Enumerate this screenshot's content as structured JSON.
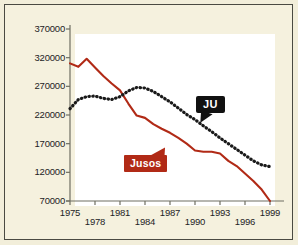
{
  "chart_data": {
    "type": "line",
    "title": "",
    "xlabel": "",
    "ylabel": "",
    "xlim": [
      1975,
      1999
    ],
    "ylim": [
      70000,
      370000
    ],
    "grid": false,
    "legend_position": "inline-callouts",
    "x": [
      1975,
      1976,
      1977,
      1978,
      1979,
      1980,
      1981,
      1982,
      1983,
      1984,
      1985,
      1986,
      1987,
      1988,
      1989,
      1990,
      1991,
      1992,
      1993,
      1994,
      1995,
      1996,
      1997,
      1998,
      1999
    ],
    "series": [
      {
        "name": "Jusos",
        "style": "solid",
        "color": "#b12a16",
        "values": [
          310000,
          304000,
          318000,
          303000,
          288000,
          275000,
          263000,
          240000,
          219000,
          215000,
          204000,
          196000,
          189000,
          180000,
          170000,
          158000,
          156000,
          156000,
          153000,
          140000,
          131000,
          118000,
          105000,
          90000,
          70000
        ]
      },
      {
        "name": "JU",
        "style": "dotted",
        "color": "#1a1a1a",
        "values": [
          231000,
          247000,
          252000,
          253000,
          249000,
          247000,
          252000,
          262000,
          268000,
          267000,
          261000,
          252000,
          243000,
          232000,
          221000,
          212000,
          201000,
          191000,
          180000,
          170000,
          160000,
          150000,
          140000,
          133000,
          130000
        ]
      }
    ],
    "yticks": [
      70000,
      120000,
      170000,
      220000,
      270000,
      320000,
      370000
    ],
    "ytick_labels": [
      "70000",
      "120000",
      "170000",
      "220000",
      "270000",
      "320000",
      "370000"
    ],
    "xticks": [
      1975,
      1978,
      1981,
      1984,
      1987,
      1990,
      1993,
      1996,
      1999
    ],
    "xtick_labels": [
      "1975",
      "1978",
      "1981",
      "1984",
      "1987",
      "1990",
      "1993",
      "1996",
      "1999"
    ],
    "annotations": [
      {
        "name": "JU",
        "label": "JU",
        "style": "black-speech-bubble",
        "text_color": "#ffffff",
        "background": "#111111"
      },
      {
        "name": "Jusos",
        "label": "Jusos",
        "style": "red-arrow-box",
        "text_color": "#ffffff",
        "background": "#b12a16"
      }
    ]
  },
  "colors": {
    "page_background": "#f5f1de",
    "plot_background": "#ffffff",
    "frame_border": "#4a4a42",
    "axis": "#6f6f62",
    "jusos_line": "#b12a16",
    "ju_line": "#1a1a1a",
    "tick_text": "#23231f"
  }
}
